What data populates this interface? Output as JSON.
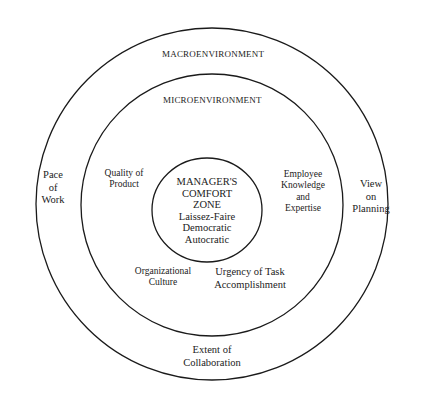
{
  "diagram": {
    "type": "concentric-circles",
    "rings": [
      {
        "name": "macroenvironment",
        "label": "MACROENVIRONMENT"
      },
      {
        "name": "microenvironment",
        "label": "MICROENVIRONMENT"
      },
      {
        "name": "comfort-zone",
        "label_lines": [
          "MANAGER'S",
          "COMFORT",
          "ZONE"
        ],
        "styles": [
          "Laissez-Faire",
          "Democratic",
          "Autocratic"
        ]
      }
    ],
    "macro_factors": {
      "pace": [
        "Pace",
        "of",
        "Work"
      ],
      "view": [
        "View",
        "on",
        "Planning"
      ],
      "collaboration": [
        "Extent of",
        "Collaboration"
      ]
    },
    "micro_factors": {
      "quality": [
        "Quality of",
        "Product"
      ],
      "knowledge": [
        "Employee",
        "Knowledge",
        "and",
        "Expertise"
      ],
      "culture": [
        "Organizational",
        "Culture"
      ],
      "urgency": [
        "Urgency of Task",
        "Accomplishment"
      ]
    },
    "colors": {
      "stroke": "#1a1a1a",
      "background": "#ffffff"
    }
  }
}
